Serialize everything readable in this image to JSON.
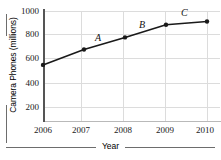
{
  "chart_data": {
    "type": "line",
    "title": "",
    "xlabel": "Year",
    "ylabel": "Camera Phones (millions)",
    "x": [
      2006,
      2007,
      2008,
      2009,
      2010
    ],
    "xticklabels": [
      "2006",
      "2007",
      "2008",
      "2009",
      "2010"
    ],
    "values": [
      510,
      650,
      760,
      875,
      905
    ],
    "yticks": [
      200,
      400,
      600,
      800,
      1000
    ],
    "yticklabels": [
      "200",
      "400",
      "600",
      "800",
      "1000"
    ],
    "ylim": [
      0,
      1000
    ],
    "xlim": [
      2006,
      2010
    ],
    "grid": true,
    "legend": false,
    "series_color": "#1a1a1a",
    "grid_color": "#dcdcdc",
    "annotations": [
      {
        "text": "A",
        "x": 2007.5,
        "y": 760
      },
      {
        "text": "B",
        "x": 2008.5,
        "y": 880
      },
      {
        "text": "C",
        "x": 2009.5,
        "y": 985
      }
    ]
  },
  "axes": {
    "ylabel": "Camera Phones (millions)",
    "xlabel": "Year",
    "yticklabels": [
      "1000",
      "800",
      "600",
      "400",
      "200"
    ],
    "xticklabels": [
      "2006",
      "2007",
      "2008",
      "2009",
      "2010"
    ]
  },
  "annotations": {
    "a": "A",
    "b": "B",
    "c": "C"
  }
}
